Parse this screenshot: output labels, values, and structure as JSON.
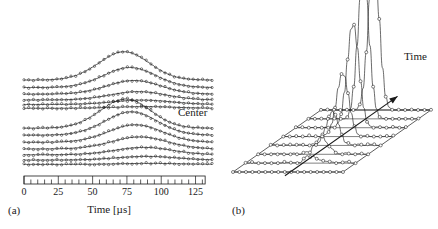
{
  "figure": {
    "background_color": "#ffffff",
    "line_color": "#1a1a1a",
    "marker_color": "#1a1a1a"
  },
  "panels": [
    {
      "id": "a",
      "label": "(a)",
      "annotations": [
        {
          "name": "center",
          "text": "Center"
        }
      ]
    },
    {
      "id": "b",
      "label": "(b)",
      "annotations": [
        {
          "name": "time-arrow",
          "text": "Time"
        }
      ]
    }
  ],
  "chart_data": [
    {
      "type": "line",
      "panel": "a",
      "title": "",
      "subtitle": "",
      "xlabel": "Time [µs]",
      "ylabel": "",
      "xlim": [
        0,
        137
      ],
      "ylim": [
        0,
        1
      ],
      "grid": false,
      "legend": null,
      "axis_box": true,
      "tick_labels": [
        "0",
        "25",
        "50",
        "75",
        "100",
        "125"
      ],
      "tick_values": [
        0,
        25,
        50,
        75,
        100,
        125
      ],
      "minor_tick_step": 5,
      "marker": "circle-open",
      "annotations": [
        {
          "text": "Center",
          "x": 118,
          "y": 0.62
        }
      ],
      "groups": [
        {
          "name": "upper-group",
          "traces": [
            {
              "name": "trace-u1",
              "baseline": 0.59,
              "amplitude": 0.17,
              "peak_x": 71,
              "width": 26
            },
            {
              "name": "trace-u2",
              "baseline": 0.545,
              "amplitude": 0.12,
              "peak_x": 75,
              "width": 27
            },
            {
              "name": "trace-u3",
              "baseline": 0.505,
              "amplitude": 0.082,
              "peak_x": 78,
              "width": 28
            },
            {
              "name": "trace-u4",
              "baseline": 0.47,
              "amplitude": 0.05,
              "peak_x": 81,
              "width": 29
            },
            {
              "name": "trace-u5",
              "baseline": 0.443,
              "amplitude": 0.026,
              "peak_x": 84,
              "width": 30
            },
            {
              "name": "trace-u6",
              "baseline": 0.42,
              "amplitude": 0.01,
              "peak_x": 86,
              "width": 31
            }
          ]
        },
        {
          "name": "lower-group",
          "traces": [
            {
              "name": "trace-l1",
              "baseline": 0.3,
              "amplitude": 0.175,
              "peak_x": 72,
              "width": 26
            },
            {
              "name": "trace-l2",
              "baseline": 0.258,
              "amplitude": 0.14,
              "peak_x": 76,
              "width": 27
            },
            {
              "name": "trace-l3",
              "baseline": 0.215,
              "amplitude": 0.105,
              "peak_x": 79,
              "width": 28
            },
            {
              "name": "trace-l4",
              "baseline": 0.175,
              "amplitude": 0.072,
              "peak_x": 82,
              "width": 29
            },
            {
              "name": "trace-l5",
              "baseline": 0.14,
              "amplitude": 0.044,
              "peak_x": 85,
              "width": 30
            },
            {
              "name": "trace-l6",
              "baseline": 0.108,
              "amplitude": 0.022,
              "peak_x": 87,
              "width": 31
            },
            {
              "name": "trace-l7",
              "baseline": 0.082,
              "amplitude": 0.006,
              "peak_x": 89,
              "width": 32
            }
          ]
        }
      ]
    },
    {
      "type": "line",
      "panel": "b",
      "title": "",
      "xlabel": "",
      "ylabel": "",
      "grid": true,
      "projection": "waterfall-3d",
      "marker": "circle-open",
      "annotations": [
        {
          "text": "Time",
          "kind": "arrow-label"
        }
      ],
      "traces": [
        {
          "name": "wf-1",
          "amplitude": 0.0,
          "peak_x": 0.62,
          "width": 0.085,
          "noise": 0.0
        },
        {
          "name": "wf-2",
          "amplitude": 0.05,
          "peak_x": 0.6,
          "width": 0.085,
          "noise": 0.02
        },
        {
          "name": "wf-3",
          "amplitude": 0.11,
          "peak_x": 0.58,
          "width": 0.085,
          "noise": 0.022
        },
        {
          "name": "wf-4",
          "amplitude": 0.22,
          "peak_x": 0.56,
          "width": 0.082,
          "noise": 0.02
        },
        {
          "name": "wf-5",
          "amplitude": 0.42,
          "peak_x": 0.54,
          "width": 0.08,
          "noise": 0.016
        },
        {
          "name": "wf-6",
          "amplitude": 0.7,
          "peak_x": 0.52,
          "width": 0.076,
          "noise": 0.012
        },
        {
          "name": "wf-7",
          "amplitude": 0.95,
          "peak_x": 0.5,
          "width": 0.072,
          "noise": 0.008
        },
        {
          "name": "wf-8",
          "amplitude": 1.0,
          "peak_x": 0.48,
          "width": 0.07,
          "noise": 0.006
        }
      ]
    }
  ]
}
